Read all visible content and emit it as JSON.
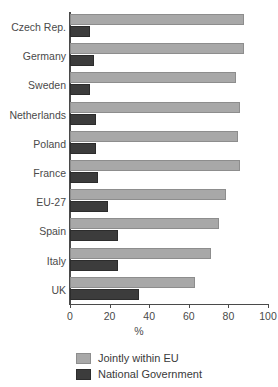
{
  "chart_data": {
    "type": "bar",
    "orientation": "horizontal",
    "title": "",
    "xlabel": "%",
    "ylabel": "",
    "xlim": [
      0,
      100
    ],
    "xticks": [
      0,
      20,
      40,
      60,
      80,
      100
    ],
    "grid": false,
    "legend_position": "bottom-left",
    "categories": [
      "Czech Rep.",
      "Germany",
      "Sweden",
      "Netherlands",
      "Poland",
      "France",
      "EU-27",
      "Spain",
      "Italy",
      "UK"
    ],
    "series": [
      {
        "name": "Jointly within EU",
        "color": "#a8a8a8",
        "values": [
          88,
          88,
          84,
          86,
          85,
          86,
          79,
          75,
          71,
          63
        ]
      },
      {
        "name": "National Government",
        "color": "#3c3c3c",
        "values": [
          10,
          12,
          10,
          13,
          13,
          14,
          19,
          24,
          24,
          35
        ]
      }
    ]
  },
  "axis": {
    "x_title": "%",
    "tick_labels": [
      "0",
      "20",
      "40",
      "60",
      "80",
      "100"
    ]
  },
  "legend": {
    "items": [
      {
        "label": "Jointly within EU",
        "color": "#a8a8a8"
      },
      {
        "label": "National Government",
        "color": "#3c3c3c"
      }
    ]
  }
}
